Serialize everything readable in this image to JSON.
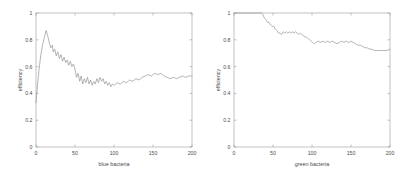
{
  "figure": {
    "background_color": "#ffffff",
    "axis_color": "#9a9a9a",
    "text_color": "#4d4d4d"
  },
  "chart_data": [
    {
      "type": "line",
      "title": "",
      "xlabel": "blue bacteria",
      "ylabel": "efficiency",
      "xlim": [
        0,
        200
      ],
      "ylim": [
        0,
        1
      ],
      "xticks": [
        0,
        50,
        100,
        150,
        200
      ],
      "xtick_labels": [
        "0",
        "50",
        "100",
        "150",
        "200"
      ],
      "yticks": [
        0,
        0.2,
        0.4,
        0.6,
        0.8,
        1
      ],
      "ytick_labels": [
        "0",
        "0.2",
        "0.4",
        "0.6",
        "0.8",
        "1"
      ],
      "grid": false,
      "legend": null,
      "line_color": "#8c8c8c",
      "series": [
        {
          "name": "efficiency",
          "x": [
            0,
            2,
            4,
            6,
            8,
            10,
            12,
            13,
            15,
            17,
            19,
            21,
            22,
            24,
            26,
            28,
            30,
            32,
            34,
            36,
            38,
            40,
            42,
            44,
            46,
            48,
            50,
            52,
            54,
            56,
            58,
            60,
            62,
            64,
            66,
            68,
            70,
            72,
            74,
            76,
            78,
            80,
            82,
            84,
            86,
            88,
            90,
            92,
            94,
            96,
            98,
            100,
            104,
            108,
            112,
            116,
            120,
            124,
            128,
            132,
            136,
            140,
            144,
            148,
            152,
            156,
            160,
            164,
            168,
            172,
            176,
            180,
            184,
            188,
            192,
            196,
            200
          ],
          "values": [
            0.33,
            0.47,
            0.58,
            0.68,
            0.75,
            0.8,
            0.85,
            0.87,
            0.83,
            0.78,
            0.74,
            0.76,
            0.71,
            0.73,
            0.68,
            0.71,
            0.66,
            0.69,
            0.64,
            0.67,
            0.63,
            0.65,
            0.61,
            0.64,
            0.6,
            0.62,
            0.58,
            0.52,
            0.55,
            0.49,
            0.53,
            0.47,
            0.51,
            0.48,
            0.52,
            0.47,
            0.5,
            0.46,
            0.49,
            0.47,
            0.51,
            0.48,
            0.52,
            0.49,
            0.51,
            0.47,
            0.49,
            0.46,
            0.48,
            0.45,
            0.47,
            0.46,
            0.48,
            0.47,
            0.49,
            0.48,
            0.5,
            0.49,
            0.51,
            0.5,
            0.52,
            0.53,
            0.54,
            0.53,
            0.55,
            0.54,
            0.55,
            0.53,
            0.52,
            0.51,
            0.52,
            0.51,
            0.52,
            0.53,
            0.52,
            0.53,
            0.53
          ]
        }
      ]
    },
    {
      "type": "line",
      "title": "",
      "xlabel": "green bacteria",
      "ylabel": "efficiency",
      "xlim": [
        0,
        200
      ],
      "ylim": [
        0,
        1
      ],
      "xticks": [
        0,
        50,
        100,
        150,
        200
      ],
      "xtick_labels": [
        "0",
        "50",
        "100",
        "150",
        "200"
      ],
      "yticks": [
        0,
        0.2,
        0.4,
        0.6,
        0.8,
        1
      ],
      "ytick_labels": [
        "0",
        "0.2",
        "0.4",
        "0.6",
        "0.8",
        "1"
      ],
      "grid": false,
      "legend": null,
      "line_color": "#8c8c8c",
      "series": [
        {
          "name": "efficiency",
          "x": [
            0,
            5,
            10,
            15,
            20,
            25,
            30,
            35,
            37,
            39,
            41,
            43,
            45,
            47,
            49,
            51,
            53,
            55,
            57,
            59,
            61,
            63,
            65,
            67,
            69,
            71,
            73,
            75,
            77,
            79,
            81,
            83,
            85,
            87,
            89,
            91,
            93,
            95,
            97,
            99,
            101,
            103,
            105,
            108,
            111,
            114,
            117,
            120,
            123,
            126,
            129,
            132,
            135,
            138,
            141,
            144,
            147,
            150,
            153,
            156,
            159,
            162,
            165,
            168,
            171,
            174,
            177,
            180,
            184,
            188,
            192,
            196,
            200
          ],
          "values": [
            1.0,
            1.0,
            1.0,
            1.0,
            1.0,
            1.0,
            1.0,
            1.0,
            0.99,
            0.96,
            0.95,
            0.93,
            0.93,
            0.91,
            0.9,
            0.9,
            0.88,
            0.87,
            0.85,
            0.85,
            0.84,
            0.86,
            0.85,
            0.86,
            0.85,
            0.86,
            0.85,
            0.86,
            0.85,
            0.86,
            0.85,
            0.84,
            0.85,
            0.84,
            0.83,
            0.82,
            0.82,
            0.81,
            0.8,
            0.79,
            0.78,
            0.77,
            0.78,
            0.79,
            0.78,
            0.79,
            0.78,
            0.79,
            0.78,
            0.79,
            0.78,
            0.77,
            0.78,
            0.79,
            0.78,
            0.79,
            0.78,
            0.79,
            0.78,
            0.77,
            0.76,
            0.76,
            0.75,
            0.74,
            0.74,
            0.73,
            0.73,
            0.72,
            0.72,
            0.72,
            0.72,
            0.72,
            0.73
          ]
        }
      ]
    }
  ]
}
